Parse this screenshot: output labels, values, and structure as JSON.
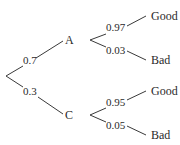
{
  "diagram": {
    "type": "probability-tree",
    "root": {
      "branches": [
        {
          "probability": "0.7",
          "node": "A",
          "children": [
            {
              "probability": "0.97",
              "outcome": "Good"
            },
            {
              "probability": "0.03",
              "outcome": "Bad"
            }
          ]
        },
        {
          "probability": "0.3",
          "node": "C",
          "children": [
            {
              "probability": "0.95",
              "outcome": "Good"
            },
            {
              "probability": "0.05",
              "outcome": "Bad"
            }
          ]
        }
      ]
    },
    "colors": {
      "line": "#3a3a3a",
      "text": "#2a2a2a",
      "background": "#ffffff"
    }
  }
}
